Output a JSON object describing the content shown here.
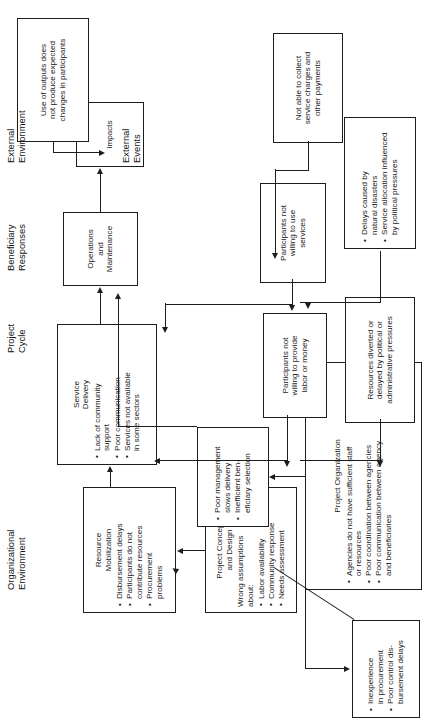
{
  "diagram": {
    "orientation": "rotated-90-ccw",
    "stage_labels": [
      {
        "id": "organizational-environment",
        "text": "Organizational\nEnvironment"
      },
      {
        "id": "project-cycle",
        "text": "Project\nCycle"
      },
      {
        "id": "beneficiary-responses",
        "text": "Beneficiary\nResponses"
      },
      {
        "id": "external-environment",
        "text": "External\nEnvironment"
      },
      {
        "id": "external-events",
        "text": "External\nEvents"
      }
    ],
    "nodes": {
      "project_concept_and_design": {
        "title": "Project Concept\nand Design",
        "lead": "Wrong assumptions\nabout:",
        "bullets": [
          "Labor availability",
          "Community response",
          "Needs assessment"
        ]
      },
      "resource_mobilization": {
        "title": "Resource\nMobilization",
        "bullets": [
          "Disbursement delays",
          "Participants do not\ncontribute resources",
          "Procurement\nproblems"
        ]
      },
      "service_delivery": {
        "title": "Service\nDelivery",
        "bullets": [
          "Lack of community\nsupport",
          "Poor communication",
          "Services not available\nin some sectors"
        ]
      },
      "operations_and_maintenance": {
        "title": "Operations\nand\nMaintenance"
      },
      "impacts": {
        "title": "Impacts"
      },
      "project_organization": {
        "title": "Project Organization",
        "bullets": [
          "Agencies do not have sufficient staff\nor resources",
          "Poor coordination between agencies",
          "Poor communication between agency\nand beneficiaries"
        ]
      },
      "procurement_problems": {
        "bullets": [
          "Inexperience\nin procurement",
          "Poor control dis-\nbursement delays"
        ]
      },
      "management_problems": {
        "bullets": [
          "Poor management\nslows delivery",
          "Inefficient ben-\neficiary selection"
        ]
      },
      "not_able_to_collect": {
        "title": "Not able to collect\nservice charges and\nother payments"
      },
      "participants_not_willing_labor": {
        "title": "Participants not\nwilling to provide\nlabor or money"
      },
      "participants_not_willing_services": {
        "title": "Participants not\nwilling to use\nservices"
      },
      "use_of_outputs": {
        "title": "Use of outputs does\nnot produce expected\nchanges in participants"
      },
      "resources_diverted": {
        "title": "Resources diverted or\ndelayed by political or\nadministrative pressures"
      },
      "external_events_box": {
        "bullets": [
          "Delays caused by\nnatural disasters",
          "Service allocation influenced\nby political pressures"
        ]
      }
    },
    "colors": {
      "stroke": "#1d1d1d",
      "background": "#ffffff",
      "text": "#1a1a1a"
    }
  }
}
